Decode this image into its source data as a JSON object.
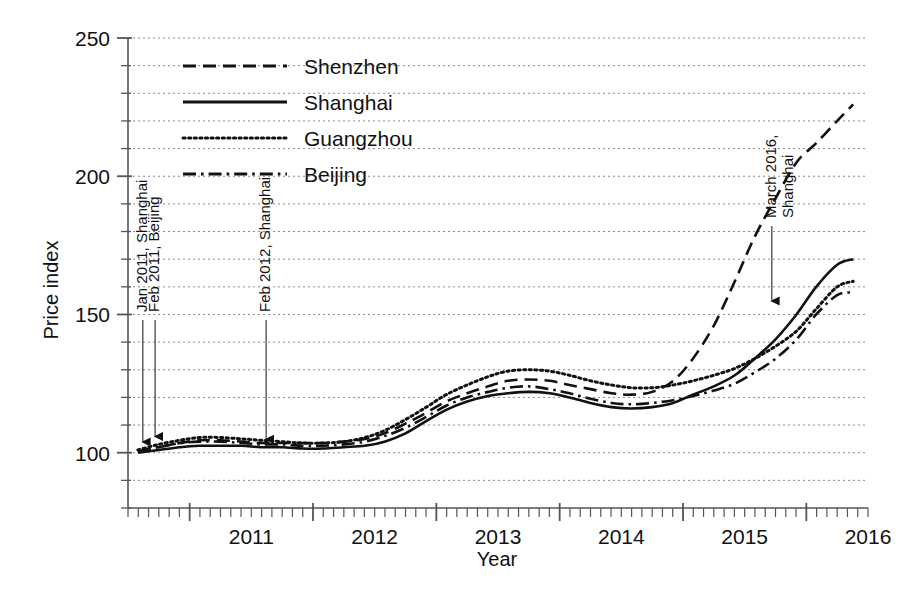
{
  "chart_data": {
    "type": "line",
    "title": "",
    "xlabel": "Year",
    "ylabel": "Price index",
    "xlim": [
      2010.5,
      2016.5
    ],
    "ylim": [
      80,
      250
    ],
    "grid": true,
    "grid_step": 10,
    "legend_position": "top-left-inside",
    "y_major_ticks": [
      100,
      150,
      200,
      250
    ],
    "y_major_tick_labels": [
      "100",
      "150",
      "200",
      "250"
    ],
    "y_minor_tick_step": 10,
    "x_ticks": [
      2011,
      2012,
      2013,
      2014,
      2015,
      2016
    ],
    "x_tick_labels": [
      "2011",
      "2012",
      "2013",
      "2014",
      "2015",
      "2016"
    ],
    "x_minor_tick_step": 0.0833,
    "series": [
      {
        "name": "Shenzhen",
        "style": "dashed",
        "x": [
          2010.58,
          2010.75,
          2010.92,
          2011.08,
          2011.25,
          2011.42,
          2011.58,
          2011.75,
          2011.92,
          2012.08,
          2012.25,
          2012.42,
          2012.58,
          2012.75,
          2012.92,
          2013.08,
          2013.25,
          2013.42,
          2013.58,
          2013.75,
          2013.92,
          2014.08,
          2014.25,
          2014.42,
          2014.58,
          2014.75,
          2014.92,
          2015.08,
          2015.25,
          2015.42,
          2015.58,
          2015.75,
          2015.92,
          2016.08,
          2016.25,
          2016.38
        ],
        "values": [
          100.5,
          102.0,
          103.5,
          104.5,
          104.5,
          104.0,
          103.5,
          103.5,
          103.5,
          103.5,
          104.0,
          105.0,
          107.0,
          110.5,
          114.5,
          118.5,
          121.5,
          124.0,
          126.0,
          126.5,
          126.0,
          124.5,
          123.0,
          121.5,
          121.0,
          122.0,
          126.0,
          134.0,
          146.0,
          162.0,
          178.0,
          192.0,
          205.0,
          212.0,
          220.0,
          226.0
        ]
      },
      {
        "name": "Shanghai",
        "style": "solid",
        "x": [
          2010.58,
          2010.75,
          2010.92,
          2011.08,
          2011.25,
          2011.42,
          2011.58,
          2011.75,
          2011.92,
          2012.08,
          2012.25,
          2012.42,
          2012.58,
          2012.75,
          2012.92,
          2013.08,
          2013.25,
          2013.42,
          2013.58,
          2013.75,
          2013.92,
          2014.08,
          2014.25,
          2014.42,
          2014.58,
          2014.75,
          2014.92,
          2015.08,
          2015.25,
          2015.42,
          2015.58,
          2015.75,
          2015.92,
          2016.08,
          2016.25,
          2016.38
        ],
        "values": [
          100.0,
          101.0,
          102.0,
          102.5,
          102.5,
          102.5,
          102.0,
          102.0,
          101.5,
          101.5,
          102.0,
          102.5,
          104.0,
          107.0,
          111.5,
          115.5,
          118.5,
          120.5,
          121.5,
          122.0,
          121.5,
          120.0,
          118.0,
          116.5,
          116.0,
          116.5,
          118.0,
          121.0,
          124.0,
          128.0,
          134.0,
          141.0,
          150.0,
          160.0,
          168.0,
          170.0
        ]
      },
      {
        "name": "Guangzhou",
        "style": "dotted",
        "x": [
          2010.58,
          2010.75,
          2010.92,
          2011.08,
          2011.25,
          2011.42,
          2011.58,
          2011.75,
          2011.92,
          2012.08,
          2012.25,
          2012.42,
          2012.58,
          2012.75,
          2012.92,
          2013.08,
          2013.25,
          2013.42,
          2013.58,
          2013.75,
          2013.92,
          2014.08,
          2014.25,
          2014.42,
          2014.58,
          2014.75,
          2014.92,
          2015.08,
          2015.25,
          2015.42,
          2015.58,
          2015.75,
          2015.92,
          2016.08,
          2016.25,
          2016.38
        ],
        "values": [
          101.0,
          103.0,
          104.5,
          105.5,
          105.5,
          105.0,
          104.5,
          104.0,
          103.5,
          103.5,
          104.0,
          105.5,
          108.0,
          112.0,
          116.5,
          121.0,
          124.5,
          127.5,
          129.5,
          130.0,
          129.5,
          128.0,
          126.0,
          124.5,
          123.5,
          123.5,
          124.5,
          126.0,
          128.0,
          130.5,
          134.0,
          138.5,
          144.0,
          152.0,
          160.0,
          162.0
        ]
      },
      {
        "name": "Beijing",
        "style": "dashdot",
        "x": [
          2010.58,
          2010.75,
          2010.92,
          2011.08,
          2011.25,
          2011.42,
          2011.58,
          2011.75,
          2011.92,
          2012.08,
          2012.25,
          2012.42,
          2012.58,
          2012.75,
          2012.92,
          2013.08,
          2013.25,
          2013.42,
          2013.58,
          2013.75,
          2013.92,
          2014.08,
          2014.25,
          2014.42,
          2014.58,
          2014.75,
          2014.92,
          2015.08,
          2015.25,
          2015.42,
          2015.58,
          2015.75,
          2015.92,
          2016.08,
          2016.25,
          2016.38
        ],
        "values": [
          100.5,
          102.0,
          103.5,
          104.0,
          104.0,
          103.5,
          103.0,
          103.0,
          102.5,
          102.5,
          103.0,
          104.0,
          106.0,
          109.0,
          113.0,
          117.0,
          120.0,
          122.0,
          123.5,
          124.0,
          123.0,
          121.5,
          119.5,
          118.0,
          117.5,
          118.0,
          119.0,
          120.5,
          122.5,
          125.0,
          129.0,
          134.0,
          141.0,
          150.0,
          157.0,
          158.0
        ]
      }
    ],
    "annotations": [
      {
        "id": "jan-2011-shanghai",
        "lines": [
          "Jan 2011, Shanghai"
        ],
        "x": 2010.62,
        "arrow_to_value": 101,
        "arrow_from_value": 148
      },
      {
        "id": "feb-2011-beijing",
        "lines": [
          "Feb 2011, Beijing"
        ],
        "x": 2010.72,
        "arrow_to_value": 103,
        "arrow_from_value": 148
      },
      {
        "id": "feb-2012-shanghai",
        "lines": [
          "Feb 2012, Shanghai"
        ],
        "x": 2011.62,
        "arrow_to_value": 102,
        "arrow_from_value": 148
      },
      {
        "id": "march-2016-shanghai",
        "lines": [
          "March 2016,",
          "Shanghai"
        ],
        "x": 2015.72,
        "arrow_to_value": 152,
        "arrow_from_value": 182
      }
    ]
  },
  "legend": {
    "items": [
      {
        "label": "Shenzhen",
        "style": "dashed"
      },
      {
        "label": "Shanghai",
        "style": "solid"
      },
      {
        "label": "Guangzhou",
        "style": "dotted"
      },
      {
        "label": "Beijing",
        "style": "dashdot"
      }
    ]
  },
  "colors": {
    "line": "#111111",
    "grid": "#8a8a8a",
    "axis": "#555555",
    "background": "#ffffff"
  }
}
